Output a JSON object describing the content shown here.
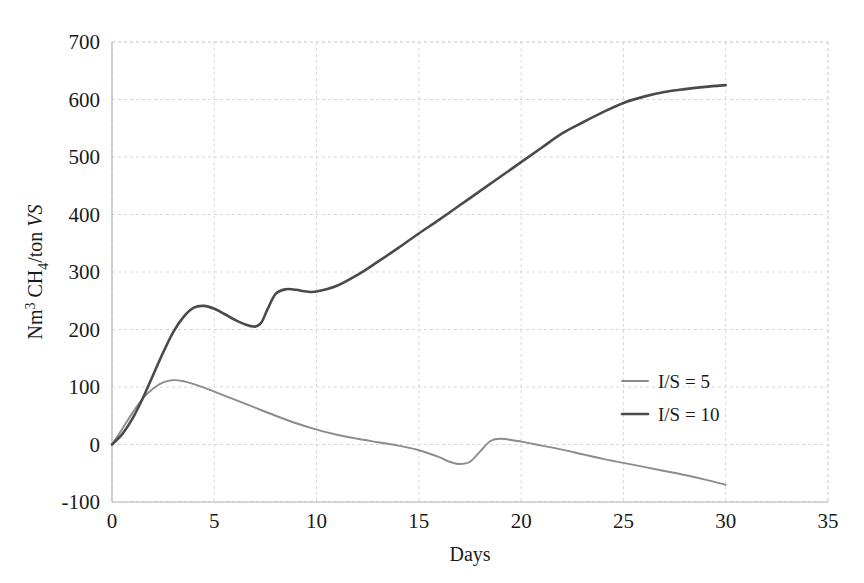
{
  "chart_data": {
    "type": "line",
    "title": "",
    "xlabel": "Days",
    "ylabel": "Nm3 CH4/ton VS",
    "ylabel_parts": {
      "prefix": "Nm",
      "sup1": "3",
      "mid": " CH",
      "sub1": "4",
      "suffix": "/ton ",
      "italic": "VS"
    },
    "xlim": [
      0,
      35
    ],
    "ylim": [
      -100,
      700
    ],
    "xticks": [
      0,
      5,
      10,
      15,
      20,
      25,
      30,
      35
    ],
    "xtick_labels": [
      "0",
      "5",
      "10",
      "15",
      "20",
      "25",
      "30",
      "35"
    ],
    "yticks": [
      -100,
      0,
      100,
      200,
      300,
      400,
      500,
      600,
      700
    ],
    "ytick_labels": [
      "-100",
      "0",
      "100",
      "200",
      "300",
      "400",
      "500",
      "600",
      "700"
    ],
    "grid": true,
    "legend_position": "center-right",
    "series": [
      {
        "name": "I/S = 5",
        "color": "#8c8c8c",
        "x": [
          0,
          0.5,
          1,
          1.5,
          2,
          2.5,
          3,
          3.5,
          4,
          4.5,
          5,
          6,
          7,
          8,
          9,
          10,
          11,
          12,
          13,
          14,
          15,
          16,
          16.5,
          17,
          17.5,
          18,
          18.5,
          19,
          20,
          21,
          22,
          23,
          24,
          25,
          26,
          27,
          28,
          29,
          30
        ],
        "y": [
          0,
          27,
          55,
          80,
          97,
          108,
          112,
          110,
          105,
          99,
          92,
          78,
          64,
          50,
          37,
          26,
          17,
          10,
          4,
          -2,
          -10,
          -22,
          -30,
          -34,
          -30,
          -12,
          6,
          10,
          5,
          -2,
          -9,
          -17,
          -25,
          -32,
          -39,
          -46,
          -53,
          -61,
          -70
        ]
      },
      {
        "name": "I/S = 10",
        "color": "#4a4a4a",
        "x": [
          0,
          0.5,
          1,
          1.5,
          2,
          2.5,
          3,
          3.5,
          4,
          4.5,
          5,
          5.5,
          6,
          6.5,
          7,
          7.3,
          7.6,
          8,
          8.5,
          9,
          9.5,
          10,
          11,
          12,
          13,
          14,
          15,
          16,
          17,
          18,
          19,
          20,
          21,
          22,
          23,
          24,
          25,
          26,
          27,
          28,
          29,
          30
        ],
        "y": [
          0,
          18,
          45,
          80,
          120,
          160,
          196,
          222,
          238,
          241,
          236,
          227,
          217,
          209,
          205,
          212,
          235,
          262,
          270,
          269,
          266,
          266,
          276,
          295,
          318,
          342,
          367,
          391,
          416,
          441,
          466,
          491,
          516,
          541,
          560,
          578,
          594,
          605,
          613,
          618,
          622,
          625
        ]
      }
    ]
  }
}
